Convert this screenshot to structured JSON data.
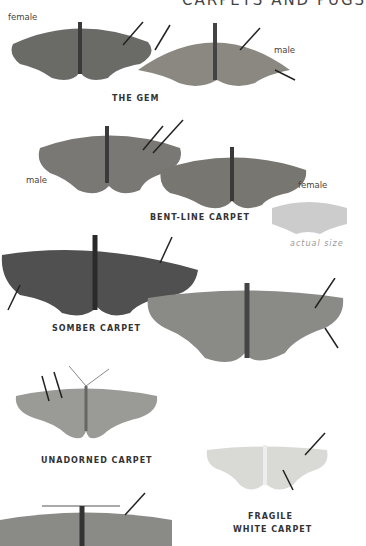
{
  "header": {
    "title": "CARPETS AND PUGS"
  },
  "species": [
    {
      "name": "THE GEM",
      "sexes": [
        "female",
        "male"
      ]
    },
    {
      "name": "BENT-LINE CARPET",
      "sexes": [
        "male",
        "female"
      ]
    },
    {
      "name": "SOMBER CARPET"
    },
    {
      "name": "UNADORNED CARPET"
    },
    {
      "name": "FRAGILE WHITE CARPET",
      "lines": [
        "FRAGILE",
        "WHITE CARPET"
      ]
    }
  ],
  "actual_size_label": "actual size",
  "colors": {
    "text": "#333333",
    "silhouette": "#cccccc"
  }
}
